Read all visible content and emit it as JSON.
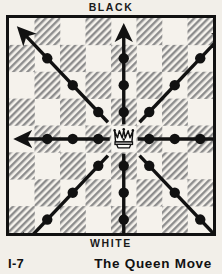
{
  "figure": {
    "top_label": "BLACK",
    "bottom_label": "WHITE",
    "caption_number": "I-7",
    "caption_title": "The Queen Move"
  },
  "colors": {
    "page_background": "#f2efe9",
    "light_square": "#f5f2ec",
    "dark_square_hatch": "#8d8d8d",
    "ink": "#111111",
    "border": "#111111"
  },
  "board": {
    "files": 8,
    "ranks": 8,
    "light_square_at_top_left": true,
    "piece": {
      "name": "white-queen",
      "glyph": "crown",
      "file_index": 4,
      "rank_index": 4,
      "square_shade": "light"
    }
  },
  "chart_data": {
    "type": "diagram",
    "title": "The Queen Move",
    "subtitle": "I-7",
    "axis_labels": {
      "top": "BLACK",
      "bottom": "WHITE"
    },
    "origin": {
      "file_index": 4,
      "rank_index": 4
    },
    "rays": [
      {
        "name": "north",
        "dx": 0,
        "dy": -1,
        "squares": 4,
        "dots": 3,
        "arrowhead": true
      },
      {
        "name": "south",
        "dx": 0,
        "dy": 1,
        "squares": 4,
        "dots": 3,
        "arrowhead": true
      },
      {
        "name": "east",
        "dx": 1,
        "dy": 0,
        "squares": 4,
        "dots": 3,
        "arrowhead": true
      },
      {
        "name": "west",
        "dx": -1,
        "dy": 0,
        "squares": 4,
        "dots": 3,
        "arrowhead": true
      },
      {
        "name": "northeast",
        "dx": 1,
        "dy": -1,
        "squares": 4,
        "dots": 3,
        "arrowhead": true
      },
      {
        "name": "northwest",
        "dx": -1,
        "dy": -1,
        "squares": 4,
        "dots": 3,
        "arrowhead": true
      },
      {
        "name": "southeast",
        "dx": 1,
        "dy": 1,
        "squares": 4,
        "dots": 3,
        "arrowhead": true
      },
      {
        "name": "southwest",
        "dx": -1,
        "dy": 1,
        "squares": 4,
        "dots": 3,
        "arrowhead": true
      }
    ]
  }
}
